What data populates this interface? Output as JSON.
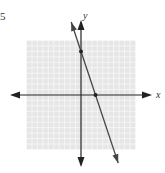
{
  "problem": {
    "number": "5"
  },
  "chart_data": {
    "type": "line",
    "title": "",
    "xlabel": "x",
    "ylabel": "y",
    "xlim": [
      -10,
      10
    ],
    "ylim": [
      -10,
      10
    ],
    "grid": true,
    "grid_step": 1,
    "series": [
      {
        "name": "line",
        "equation": "y = -3x + 8",
        "slope": -3,
        "intercept": 8,
        "x": [
          -1.8,
          6.83
        ],
        "y": [
          13.4,
          -12.5
        ]
      }
    ],
    "points": [
      {
        "label": "y-intercept",
        "x": 0,
        "y": 8
      },
      {
        "label": "x-intercept",
        "x": 2.67,
        "y": 0
      }
    ]
  },
  "labels": {
    "x_axis": "x",
    "y_axis": "y"
  },
  "colors": {
    "grid_bg": "#e6e6e6",
    "grid_line": "#f8f8f8",
    "axis": "#222222",
    "line": "#444444"
  }
}
